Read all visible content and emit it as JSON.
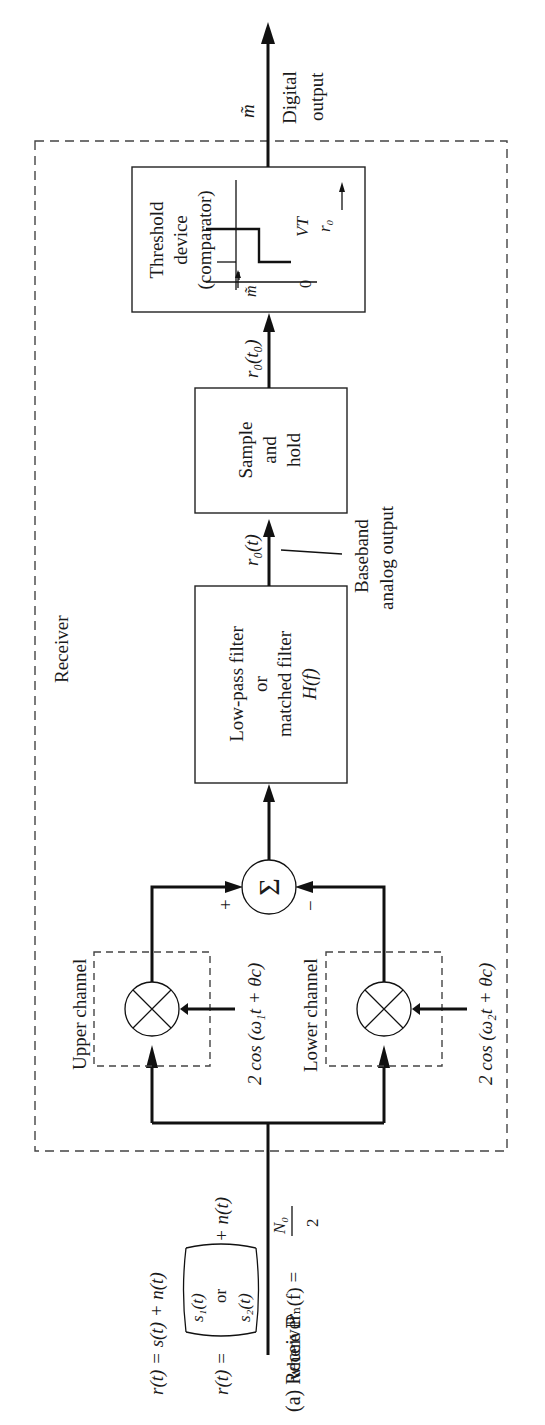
{
  "figure": {
    "caption": "(a) Receiver",
    "orientation": "rotated 90° counter-clockwise",
    "receiver_label": "Receiver"
  },
  "input": {
    "eq1": "r(t) = s(t) + n(t)",
    "eq2_prefix": "r(t) =",
    "eq2_s1": "s₁(t)",
    "eq2_or": "or",
    "eq2_s2": "s₂(t)",
    "eq2_suffix": "+ n(t)",
    "noise_psd": "where ℙₙ(f) =",
    "noise_num": "N₀",
    "noise_den": "2"
  },
  "upper_channel": {
    "label": "Upper channel",
    "oscillator": "2 cos (ω₁t + θc)",
    "sign": "+"
  },
  "lower_channel": {
    "label": "Lower channel",
    "oscillator": "2 cos (ω₂t + θc)",
    "sign": "−"
  },
  "summer": {
    "symbol": "Σ"
  },
  "filter": {
    "line1": "Low-pass filter",
    "line2": "or",
    "line3": "matched filter",
    "line4": "H(f)"
  },
  "baseband": {
    "signal": "r₀(t)",
    "line1": "Baseband",
    "line2": "analog output"
  },
  "sample_hold": {
    "line1": "Sample",
    "line2": "and",
    "line3": "hold",
    "output": "r₀(t₀)"
  },
  "threshold": {
    "line1": "Threshold",
    "line2": "device",
    "line3": "(comparator)",
    "vt": "VT",
    "zero": "0",
    "x_axis": "r₀",
    "y_axis": "m̃"
  },
  "output": {
    "symbol": "m̃",
    "line1": "Digital",
    "line2": "output"
  }
}
